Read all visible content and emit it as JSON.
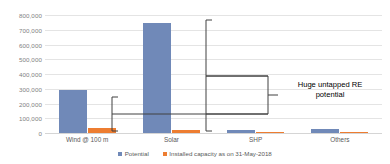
{
  "chart_data": {
    "type": "bar",
    "title": "",
    "xlabel": "",
    "ylabel": "",
    "ylim": [
      0,
      800000
    ],
    "grid": true,
    "legend_position": "bottom",
    "categories": [
      "Wind @ 100 m",
      "Solar",
      "SHP",
      "Others"
    ],
    "y_ticks": [
      "0",
      "100,000",
      "200,000",
      "300,000",
      "400,000",
      "500,000",
      "600,000",
      "700,000",
      "800,000"
    ],
    "y_tick_values": [
      0,
      100000,
      200000,
      300000,
      400000,
      500000,
      600000,
      700000,
      800000
    ],
    "series": [
      {
        "name": "Potential",
        "color": "#7089b8",
        "values": [
          295000,
          748000,
          21000,
          25000
        ]
      },
      {
        "name": "Installed capacity as on 31-May-2018",
        "color": "#ed7d31",
        "values": [
          34000,
          22000,
          4500,
          10000
        ]
      }
    ],
    "annotations": [
      {
        "text": "Huge untapped RE\npotential",
        "kind": "callout-with-brackets"
      }
    ]
  },
  "legend": {
    "items": [
      {
        "label": "Potential",
        "color": "#7089b8"
      },
      {
        "label": "Installed capacity as on 31-May-2018",
        "color": "#ed7d31"
      }
    ]
  },
  "annotation": {
    "label": "Huge untapped RE\npotential"
  },
  "colors": {
    "potential": "#7089b8",
    "installed": "#ed7d31",
    "gridline": "#e4e4e4",
    "axis_text": "#7f7f7f",
    "category_text": "#595959",
    "annotation_stroke": "#404040",
    "background": "#ffffff"
  }
}
